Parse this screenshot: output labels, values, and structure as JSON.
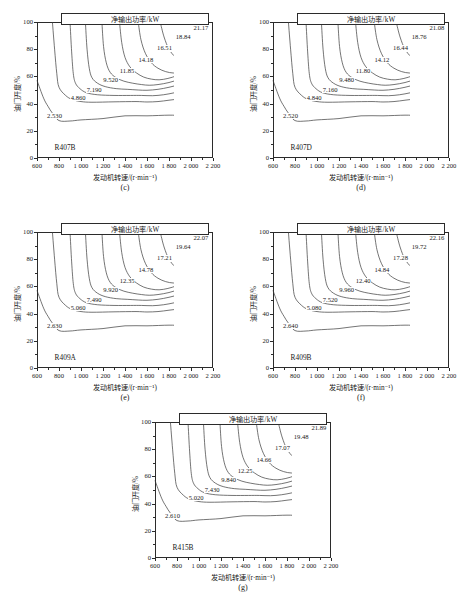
{
  "figure": {
    "title_box_label": "净输出功率/kW",
    "xlabel": "发动机转速/(r·min⁻¹)",
    "ylabel": "油门开度/%",
    "xticks": [
      "600",
      "800",
      "1 000",
      "1 200",
      "1 400",
      "1 600",
      "1 800",
      "2 000",
      "2 200"
    ],
    "yticks": [
      "0",
      "20",
      "40",
      "60",
      "80",
      "100"
    ],
    "xlim": [
      600,
      2200
    ],
    "ylim": [
      0,
      100
    ]
  },
  "chart_data": [
    {
      "type": "contour",
      "panel": "(c)",
      "refrigerant": "R407B",
      "title": "净输出功率/kW",
      "xlabel": "发动机转速/(r·min⁻¹)",
      "ylabel": "油门开度/%",
      "xlim": [
        600,
        2200
      ],
      "ylim": [
        0,
        100
      ],
      "grid": false,
      "levels": [
        2.53,
        4.86,
        7.19,
        9.52,
        11.85,
        14.18,
        16.51,
        18.84,
        21.17
      ],
      "level_labels": [
        "2.530",
        "4.860",
        "7.190",
        "9.520",
        "11.85",
        "14.18",
        "16.51",
        "18.84",
        "21.17"
      ]
    },
    {
      "type": "contour",
      "panel": "(d)",
      "refrigerant": "R407D",
      "title": "净输出功率/kW",
      "xlabel": "发动机转速/(r·min⁻¹)",
      "ylabel": "油门开度/%",
      "xlim": [
        600,
        2200
      ],
      "ylim": [
        0,
        100
      ],
      "grid": false,
      "levels": [
        2.52,
        4.84,
        7.16,
        9.48,
        11.8,
        14.12,
        16.44,
        18.76,
        21.08
      ],
      "level_labels": [
        "2.520",
        "4.840",
        "7.160",
        "9.480",
        "11.80",
        "14.12",
        "16.44",
        "18.76",
        "21.08"
      ]
    },
    {
      "type": "contour",
      "panel": "(e)",
      "refrigerant": "R409A",
      "title": "净输出功率/kW",
      "xlabel": "发动机转速/(r·min⁻¹)",
      "ylabel": "油门开度/%",
      "xlim": [
        600,
        2200
      ],
      "ylim": [
        0,
        100
      ],
      "grid": false,
      "levels": [
        2.63,
        5.06,
        7.49,
        9.92,
        12.35,
        14.78,
        17.21,
        19.64,
        22.07
      ],
      "level_labels": [
        "2.630",
        "5.060",
        "7.490",
        "9.920",
        "12.35",
        "14.78",
        "17.21",
        "19.64",
        "22.07"
      ]
    },
    {
      "type": "contour",
      "panel": "(f)",
      "refrigerant": "R409B",
      "title": "净输出功率/kW",
      "xlabel": "发动机转速/(r·min⁻¹)",
      "ylabel": "油门开度/%",
      "xlim": [
        600,
        2200
      ],
      "ylim": [
        0,
        100
      ],
      "grid": false,
      "levels": [
        2.64,
        5.08,
        7.52,
        9.96,
        12.4,
        14.84,
        17.28,
        19.72,
        22.16
      ],
      "level_labels": [
        "2.640",
        "5.080",
        "7.520",
        "9.960",
        "12.40",
        "14.84",
        "17.28",
        "19.72",
        "22.16"
      ]
    },
    {
      "type": "contour",
      "panel": "(g)",
      "refrigerant": "R415B",
      "title": "净输出功率/kW",
      "xlabel": "发动机转速/(r·min⁻¹)",
      "ylabel": "油门开度/%",
      "xlim": [
        600,
        2200
      ],
      "ylim": [
        0,
        100
      ],
      "grid": false,
      "levels": [
        2.61,
        5.02,
        7.43,
        9.84,
        12.25,
        14.66,
        17.07,
        19.48,
        21.89
      ],
      "level_labels": [
        "2.610",
        "5.020",
        "7.430",
        "9.840",
        "12.25",
        "14.66",
        "17.07",
        "19.48",
        "21.89"
      ]
    }
  ],
  "panels": [
    {
      "letter": "(c)",
      "refrigerant": "R407B"
    },
    {
      "letter": "(d)",
      "refrigerant": "R407D"
    },
    {
      "letter": "(e)",
      "refrigerant": "R409A"
    },
    {
      "letter": "(f)",
      "refrigerant": "R409B"
    },
    {
      "letter": "(g)",
      "refrigerant": "R415B"
    }
  ]
}
